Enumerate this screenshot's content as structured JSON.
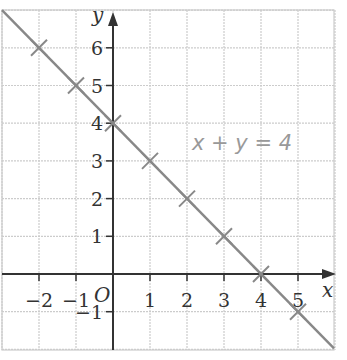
{
  "chart_data": {
    "type": "line",
    "title": "",
    "xlabel": "x",
    "ylabel": "y",
    "origin_label": "O",
    "xlim": [
      -3,
      6
    ],
    "ylim": [
      -2,
      7
    ],
    "grid": true,
    "x_ticks": [
      -2,
      -1,
      1,
      2,
      3,
      4,
      5
    ],
    "y_ticks": [
      -1,
      1,
      2,
      3,
      4,
      5,
      6
    ],
    "x_tick_labels": [
      "−2",
      "−1",
      "1",
      "2",
      "3",
      "4",
      "5"
    ],
    "y_tick_labels": [
      "−1",
      "1",
      "2",
      "3",
      "4",
      "5",
      "6"
    ],
    "series": [
      {
        "name": "x + y = 4",
        "line": true,
        "marker": "x",
        "x": [
          -2,
          -1,
          0,
          1,
          2,
          3,
          4,
          5
        ],
        "y": [
          6,
          5,
          4,
          3,
          2,
          1,
          0,
          -1
        ]
      }
    ],
    "annotations": [
      {
        "text": "x + y = 4",
        "x": 3.1,
        "y": 3.5
      }
    ],
    "colors": {
      "line": "#888888",
      "axis": "#333333",
      "grid": "#cccccc",
      "label": "#999999"
    }
  }
}
